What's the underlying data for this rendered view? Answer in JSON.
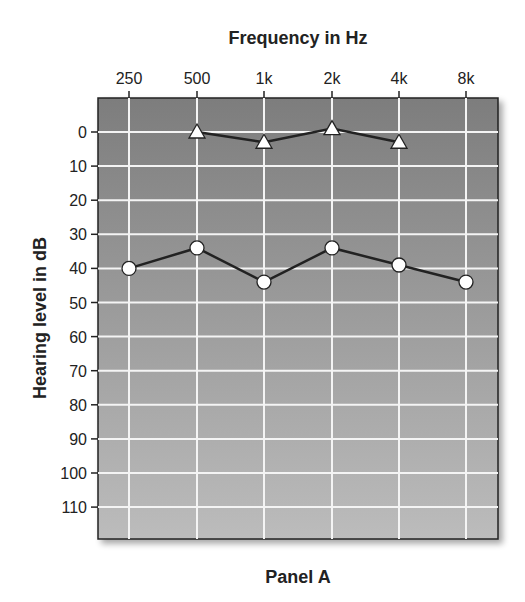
{
  "chart_data": {
    "type": "line",
    "title": "Frequency in Hz",
    "xlabel": "Frequency in Hz",
    "ylabel": "Hearing level in dB",
    "caption": "Panel A",
    "categories": [
      "250",
      "500",
      "1k",
      "2k",
      "4k",
      "8k"
    ],
    "yticks": [
      0,
      10,
      20,
      30,
      40,
      50,
      60,
      70,
      80,
      90,
      100,
      110
    ],
    "ylim": [
      -10,
      120
    ],
    "y_inverted": true,
    "grid": true,
    "legend": "none",
    "series": [
      {
        "name": "triangle",
        "marker": "triangle",
        "values": [
          null,
          0,
          3,
          -1,
          3,
          null
        ]
      },
      {
        "name": "circle",
        "marker": "circle",
        "values": [
          40,
          34,
          44,
          34,
          39,
          44
        ]
      }
    ]
  },
  "labels": {
    "title": "Frequency in Hz",
    "ylabel": "Hearing level in dB",
    "caption": "Panel A"
  }
}
